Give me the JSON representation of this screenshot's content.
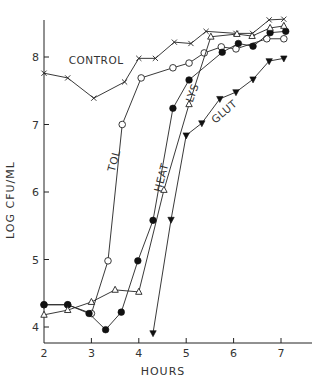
{
  "chart_data": {
    "type": "line",
    "title": "",
    "xlabel": "HOURS",
    "ylabel": "LOG CFU/ML",
    "xlim": [
      2,
      7.5
    ],
    "ylim": [
      3.8,
      8.7
    ],
    "xticks": [
      2,
      3,
      4,
      5,
      6,
      7
    ],
    "yticks": [
      4,
      5,
      6,
      7,
      8
    ],
    "grid": false,
    "legend": "none (inline annotations)",
    "series": [
      {
        "name": "CONTROL",
        "marker": "x",
        "x": [
          2.0,
          2.5,
          3.05,
          3.7,
          4.0,
          4.35,
          4.75,
          5.1,
          5.42,
          6.05,
          6.4,
          6.75,
          7.06
        ],
        "y": [
          7.76,
          7.69,
          7.39,
          7.63,
          7.98,
          7.98,
          8.22,
          8.2,
          8.38,
          8.35,
          8.35,
          8.55,
          8.56
        ]
      },
      {
        "name": "TOL",
        "marker": "open-circle",
        "x": [
          2.0,
          2.5,
          3.0,
          3.35,
          3.65,
          4.05,
          4.72,
          5.06,
          5.38,
          5.74,
          6.05,
          6.7,
          7.06
        ],
        "y": [
          4.33,
          4.33,
          4.2,
          4.98,
          7.0,
          7.69,
          7.84,
          7.91,
          8.06,
          8.15,
          8.12,
          8.27,
          8.27
        ]
      },
      {
        "name": "HEAT",
        "marker": "filled-circle",
        "x": [
          2.0,
          2.5,
          2.95,
          3.3,
          3.63,
          3.98,
          4.3,
          4.72,
          5.06,
          5.76,
          6.1,
          6.41,
          6.77,
          7.1
        ],
        "y": [
          4.33,
          4.33,
          4.2,
          3.96,
          4.22,
          4.98,
          5.58,
          7.24,
          7.66,
          8.07,
          8.2,
          8.16,
          8.36,
          8.38
        ]
      },
      {
        "name": "LYS",
        "marker": "open-triangle",
        "x": [
          2.0,
          2.5,
          3.0,
          3.5,
          4.0,
          4.53,
          5.06,
          5.52,
          6.07,
          6.39,
          6.77,
          7.06
        ],
        "y": [
          4.18,
          4.25,
          4.37,
          4.55,
          4.52,
          6.03,
          7.3,
          8.3,
          8.34,
          8.31,
          8.43,
          8.46
        ]
      },
      {
        "name": "GLUT",
        "marker": "filled-inverted-triangle",
        "x": [
          4.3,
          4.68,
          5.0,
          5.33,
          5.71,
          6.05,
          6.41,
          6.75,
          7.06
        ],
        "y": [
          3.91,
          5.59,
          6.84,
          7.02,
          7.38,
          7.48,
          7.67,
          7.94,
          7.98
        ]
      }
    ],
    "annotations": [
      {
        "text": "CONTROL",
        "x": 3.1,
        "y": 7.9,
        "rotation": 0
      },
      {
        "text": "TOL",
        "x": 3.55,
        "y": 6.45,
        "rotation": -75
      },
      {
        "text": "HEAT",
        "x": 4.55,
        "y": 6.2,
        "rotation": -75
      },
      {
        "text": "LYS",
        "x": 5.2,
        "y": 7.45,
        "rotation": -70
      },
      {
        "text": "GLUT",
        "x": 5.85,
        "y": 7.15,
        "rotation": -40
      }
    ]
  },
  "labels": {
    "xlabel": "HOURS",
    "ylabel": "LOG CFU/ML"
  }
}
